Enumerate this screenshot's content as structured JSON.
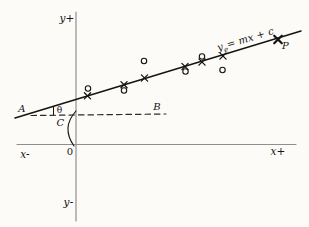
{
  "colors": {
    "background": "#fcfbf8",
    "ink": "#141414",
    "axis": "#8f8f8f",
    "dash": "#2b2b2b"
  },
  "labels": {
    "y_axis_positive": "y+",
    "y_axis_negative": "y-",
    "x_axis_negative": "x-",
    "x_axis_positive": "x+",
    "origin": "0",
    "point_a": "A",
    "point_b": "B",
    "intercept_c": "C",
    "angle_theta": "θ",
    "point_p": "P",
    "equation": {
      "base": "y",
      "subscript": "e",
      "rest": "= mx + c"
    }
  },
  "geometry": {
    "canvas": {
      "width": 309,
      "height": 227
    },
    "y_axis": {
      "x1": 76,
      "y1": 12,
      "x2": 76,
      "y2": 221
    },
    "x_axis": {
      "x1": 17,
      "y1": 144.5,
      "x2": 296,
      "y2": 144.5
    },
    "regression_line": {
      "x1": 15,
      "y1": 118,
      "x2": 301,
      "y2": 31
    },
    "dashed_line_ab": {
      "x1": 31,
      "y1": 115.5,
      "x2": 166,
      "y2": 114,
      "dash": "5.5 4"
    },
    "angle_tick": {
      "x1": 53.5,
      "y1": 107,
      "x2": 53.5,
      "y2": 115
    },
    "intercept_brace": {
      "top": [
        76,
        111
      ],
      "control": [
        61,
        127.5
      ],
      "bottom": [
        74,
        146
      ]
    },
    "fitted_points": [
      {
        "x": 87.5,
        "y": 95.8
      },
      {
        "x": 124,
        "y": 84.7
      },
      {
        "x": 144.5,
        "y": 78
      },
      {
        "x": 185,
        "y": 66.5
      },
      {
        "x": 202,
        "y": 62
      },
      {
        "x": 223,
        "y": 56
      },
      {
        "x": 278,
        "y": 39.5,
        "bold": true
      }
    ],
    "observed_points": [
      {
        "x": 88,
        "y": 88.5
      },
      {
        "x": 124,
        "y": 90.5
      },
      {
        "x": 144,
        "y": 61
      },
      {
        "x": 185.5,
        "y": 71.5
      },
      {
        "x": 202,
        "y": 56.5
      },
      {
        "x": 222.5,
        "y": 70
      }
    ]
  }
}
